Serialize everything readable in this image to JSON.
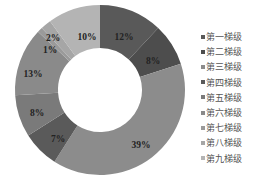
{
  "chart_data": {
    "type": "pie",
    "subtype": "donut",
    "title": "",
    "categories": [
      "第一梯级",
      "第二梯级",
      "第三梯级",
      "第四梯级",
      "第五梯级",
      "第六梯级",
      "第七梯级",
      "第八梯级",
      "第九梯级"
    ],
    "values": [
      12,
      8,
      39,
      7,
      8,
      13,
      1,
      2,
      10
    ],
    "labels": [
      "12%",
      "8%",
      "39%",
      "7%",
      "8%",
      "13%",
      "1%",
      "2%",
      "10%"
    ],
    "colors": [
      "#595959",
      "#4d4d4d",
      "#8c8c8c",
      "#5a5a5a",
      "#7a7a7a",
      "#8a8a8a",
      "#9a9a9a",
      "#a6a6a6",
      "#b4b4b4"
    ],
    "start_angle": 0,
    "direction": "clockwise",
    "legend_position": "right"
  },
  "legend": {
    "items": [
      "第一梯级",
      "第二梯级",
      "第三梯级",
      "第四梯级",
      "第五梯级",
      "第六梯级",
      "第七梯级",
      "第八梯级",
      "第九梯级"
    ]
  }
}
